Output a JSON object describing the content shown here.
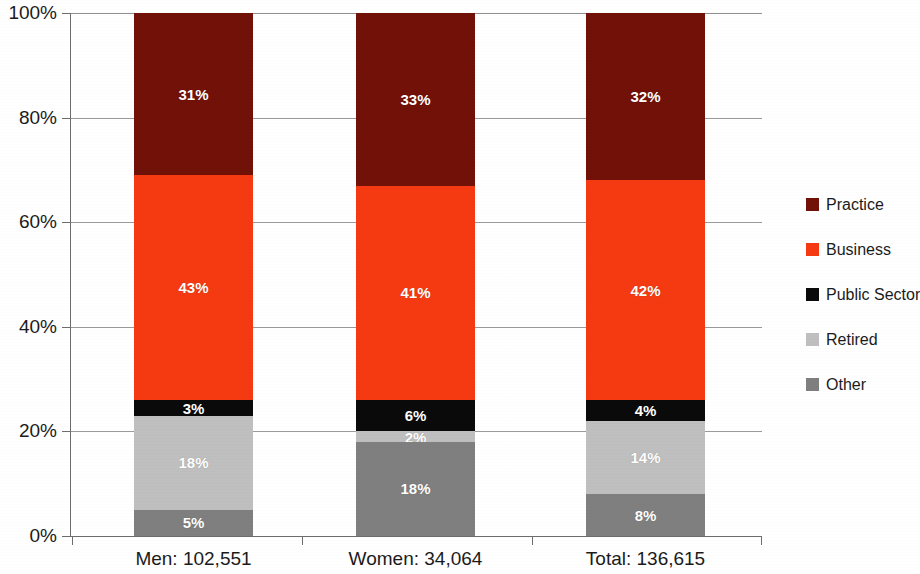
{
  "chart_data": {
    "type": "bar",
    "stacked": true,
    "normalized_percent": true,
    "title": "",
    "subtitle": "",
    "xlabel": "",
    "ylabel": "",
    "ylim": [
      0,
      100
    ],
    "ytick_labels": [
      "0%",
      "20%",
      "40%",
      "60%",
      "80%",
      "100%"
    ],
    "ytick_values": [
      0,
      20,
      40,
      60,
      80,
      100
    ],
    "grid": true,
    "grid_axis": "y",
    "legend_position": "right",
    "categories": [
      "Men: 102,551",
      "Women: 34,064",
      "Total: 136,615"
    ],
    "series": [
      {
        "name": "Other",
        "color": "#7f7f7f",
        "values": [
          5,
          18,
          8
        ],
        "labels": [
          "5%",
          "18%",
          "8%"
        ]
      },
      {
        "name": "Retired",
        "color": "#bfbfbf",
        "values": [
          18,
          2,
          14
        ],
        "labels": [
          "18%",
          "2%",
          "14%"
        ]
      },
      {
        "name": "Public Sector",
        "color": "#0a0a0a",
        "values": [
          3,
          6,
          4
        ],
        "labels": [
          "3%",
          "6%",
          "4%"
        ]
      },
      {
        "name": "Business",
        "color": "#f53a12",
        "values": [
          43,
          41,
          42
        ],
        "labels": [
          "43%",
          "41%",
          "42%"
        ]
      },
      {
        "name": "Practice",
        "color": "#711108",
        "values": [
          31,
          33,
          32
        ],
        "labels": [
          "31%",
          "33%",
          "32%"
        ]
      }
    ],
    "legend_order": [
      "Practice",
      "Business",
      "Public Sector",
      "Retired",
      "Other"
    ]
  },
  "legend": {
    "items": [
      {
        "label": "Practice",
        "color": "#711108"
      },
      {
        "label": "Business",
        "color": "#f53a12"
      },
      {
        "label": "Public Sector",
        "color": "#0a0a0a"
      },
      {
        "label": "Retired",
        "color": "#bfbfbf"
      },
      {
        "label": "Other",
        "color": "#7f7f7f"
      }
    ]
  },
  "axis": {
    "y_ticks": [
      {
        "label": "100%",
        "value": 100
      },
      {
        "label": "80%",
        "value": 80
      },
      {
        "label": "60%",
        "value": 60
      },
      {
        "label": "40%",
        "value": 40
      },
      {
        "label": "20%",
        "value": 20
      },
      {
        "label": "0%",
        "value": 0
      }
    ],
    "x_categories": [
      "Men: 102,551",
      "Women: 34,064",
      "Total: 136,615"
    ]
  },
  "colors": {
    "practice": "#711108",
    "business": "#f53a12",
    "public_sector": "#0a0a0a",
    "retired": "#bfbfbf",
    "other": "#7f7f7f",
    "gridline": "#9a9a9a",
    "axis": "#6d6d6d",
    "text": "#1b1b1b",
    "label_text": "#ffffff",
    "background": "#ffffff"
  }
}
